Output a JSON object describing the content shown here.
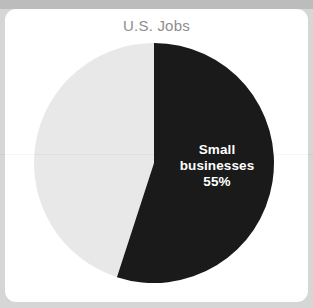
{
  "canvas": {
    "width": 313,
    "height": 308,
    "background_color": "#d6d6d6",
    "top_band_color": "#bcbcbc"
  },
  "card": {
    "background_color": "#ffffff",
    "corner_radius": 11
  },
  "chart_data": {
    "type": "pie",
    "title": "U.S. Jobs",
    "title_color": "#8d8d8d",
    "categories": [
      "Small businesses",
      "Other"
    ],
    "values": [
      55,
      45
    ],
    "labels": [
      "55%",
      "45%"
    ],
    "colors": [
      "#1a1a1a",
      "#e8e8e8"
    ],
    "legend": "none",
    "grid": false,
    "xlabel": "",
    "ylabel": "",
    "start_angle_deg": 0,
    "direction": "clockwise",
    "annotations": [
      {
        "target": "Small businesses",
        "lines": [
          "Small",
          "businesses",
          "55%"
        ],
        "color": "#ffffff",
        "position": "inside"
      }
    ],
    "geometry": {
      "center_x": 149,
      "center_y": 154,
      "radius": 120
    }
  },
  "slice_label": {
    "line1": "Small",
    "line2": "businesses",
    "line3": "55%"
  }
}
